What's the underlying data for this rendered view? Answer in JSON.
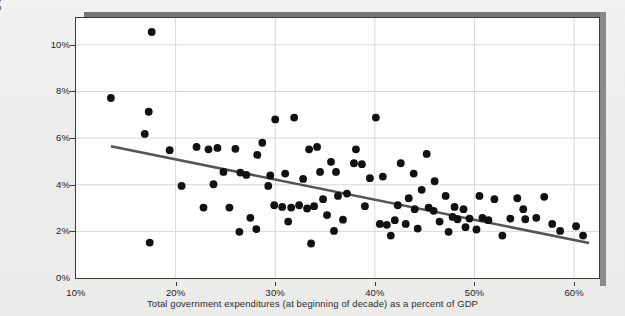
{
  "figure": {
    "cut_off_text_top": "",
    "background_color": "#eeeeec",
    "plot_background_color": "#ffffff",
    "frame_color": "#3b3b3b",
    "gridline_color": "#d8d8d8",
    "point_color": "#111111",
    "trendline_color": "#555555"
  },
  "chart_data": {
    "type": "scatter",
    "title": "",
    "xlabel": "Total government expenditures (at beginning of decade) as a percent of GDP",
    "ylabel": "Decade-long growth rate",
    "xlim": [
      10,
      62.5
    ],
    "ylim": [
      0,
      11.15
    ],
    "grid": true,
    "legend": "none",
    "xticks": [
      10,
      20,
      30,
      40,
      50,
      60
    ],
    "xtick_labels": [
      "10%",
      "20%",
      "30%",
      "40%",
      "50%",
      "60%"
    ],
    "yticks": [
      0,
      2,
      4,
      6,
      8,
      10
    ],
    "ytick_labels": [
      "0%",
      "2%",
      "4%",
      "6%",
      "8%",
      "10%"
    ],
    "trendline": {
      "type": "linear-fit",
      "x_start": 13.5,
      "y_start": 5.65,
      "x_end": 61.5,
      "y_end": 1.5
    },
    "points": [
      [
        17.6,
        10.55
      ],
      [
        13.5,
        7.72
      ],
      [
        17.3,
        7.13
      ],
      [
        16.9,
        6.18
      ],
      [
        19.4,
        5.48
      ],
      [
        22.1,
        5.62
      ],
      [
        17.4,
        1.52
      ],
      [
        23.3,
        5.52
      ],
      [
        24.2,
        5.58
      ],
      [
        26.0,
        5.54
      ],
      [
        20.6,
        3.95
      ],
      [
        24.8,
        4.55
      ],
      [
        28.2,
        5.28
      ],
      [
        30.0,
        6.8
      ],
      [
        31.9,
        6.88
      ],
      [
        28.7,
        5.8
      ],
      [
        26.5,
        4.52
      ],
      [
        27.1,
        4.42
      ],
      [
        29.5,
        4.4
      ],
      [
        27.5,
        2.58
      ],
      [
        28.1,
        2.1
      ],
      [
        26.4,
        1.98
      ],
      [
        30.7,
        3.05
      ],
      [
        31.3,
        2.42
      ],
      [
        29.3,
        3.95
      ],
      [
        32.8,
        4.25
      ],
      [
        33.9,
        3.08
      ],
      [
        33.2,
        2.98
      ],
      [
        31.6,
        3.02
      ],
      [
        32.4,
        3.12
      ],
      [
        34.5,
        4.55
      ],
      [
        35.6,
        4.98
      ],
      [
        34.2,
        5.62
      ],
      [
        33.4,
        5.52
      ],
      [
        36.3,
        3.52
      ],
      [
        35.2,
        2.7
      ],
      [
        33.6,
        1.48
      ],
      [
        36.8,
        2.5
      ],
      [
        37.9,
        4.92
      ],
      [
        38.7,
        4.88
      ],
      [
        38.1,
        5.52
      ],
      [
        39.5,
        4.28
      ],
      [
        37.2,
        3.62
      ],
      [
        39.0,
        3.08
      ],
      [
        40.1,
        6.88
      ],
      [
        40.5,
        2.32
      ],
      [
        41.2,
        2.28
      ],
      [
        42.0,
        2.48
      ],
      [
        41.6,
        1.82
      ],
      [
        43.1,
        2.32
      ],
      [
        40.8,
        4.35
      ],
      [
        42.6,
        4.92
      ],
      [
        43.9,
        4.48
      ],
      [
        44.7,
        3.78
      ],
      [
        43.4,
        3.42
      ],
      [
        45.2,
        5.32
      ],
      [
        45.9,
        2.88
      ],
      [
        46.5,
        2.42
      ],
      [
        44.3,
        2.12
      ],
      [
        47.1,
        3.52
      ],
      [
        46.0,
        4.15
      ],
      [
        47.8,
        2.62
      ],
      [
        48.3,
        2.52
      ],
      [
        48.9,
        2.95
      ],
      [
        47.4,
        1.98
      ],
      [
        49.5,
        2.55
      ],
      [
        49.1,
        2.18
      ],
      [
        50.2,
        2.08
      ],
      [
        50.8,
        2.58
      ],
      [
        51.4,
        2.48
      ],
      [
        52.0,
        3.38
      ],
      [
        52.8,
        1.82
      ],
      [
        53.6,
        2.55
      ],
      [
        54.3,
        3.42
      ],
      [
        55.1,
        2.52
      ],
      [
        56.2,
        2.58
      ],
      [
        57.0,
        3.48
      ],
      [
        57.8,
        2.32
      ],
      [
        58.6,
        2.02
      ],
      [
        60.2,
        2.22
      ],
      [
        60.9,
        1.82
      ],
      [
        36.1,
        4.55
      ],
      [
        34.8,
        3.38
      ],
      [
        31.0,
        4.48
      ],
      [
        29.9,
        3.12
      ],
      [
        25.4,
        3.02
      ],
      [
        23.8,
        4.02
      ],
      [
        22.8,
        3.02
      ],
      [
        42.3,
        3.12
      ],
      [
        44.0,
        2.95
      ],
      [
        45.4,
        3.02
      ],
      [
        48.0,
        3.05
      ],
      [
        50.5,
        3.52
      ],
      [
        54.9,
        2.95
      ],
      [
        35.9,
        2.02
      ]
    ]
  }
}
